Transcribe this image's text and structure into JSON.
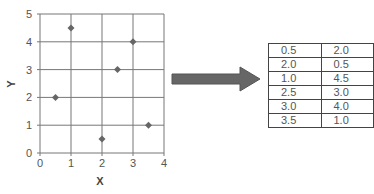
{
  "chart_data": {
    "type": "scatter",
    "title": "",
    "xlabel": "X",
    "ylabel": "Y",
    "xlim": [
      0,
      4
    ],
    "ylim": [
      0,
      5
    ],
    "x_ticks": [
      "0",
      "1",
      "2",
      "3",
      "4"
    ],
    "y_ticks": [
      "0",
      "1",
      "2",
      "3",
      "4",
      "5"
    ],
    "grid": true,
    "legend": null,
    "series": [
      {
        "name": "points",
        "marker": "diamond",
        "color": "#666666",
        "points": [
          {
            "x": 0.5,
            "y": 2.0
          },
          {
            "x": 1.0,
            "y": 4.5
          },
          {
            "x": 2.0,
            "y": 0.5
          },
          {
            "x": 2.5,
            "y": 3.0
          },
          {
            "x": 3.0,
            "y": 4.0
          },
          {
            "x": 3.5,
            "y": 1.0
          }
        ]
      }
    ]
  },
  "arrow": {
    "color": "#666666",
    "direction": "right"
  },
  "table": {
    "rows": [
      [
        "0.5",
        "2.0"
      ],
      [
        "2.0",
        "0.5"
      ],
      [
        "1.0",
        "4.5"
      ],
      [
        "2.5",
        "3.0"
      ],
      [
        "3.0",
        "4.0"
      ],
      [
        "3.5",
        "1.0"
      ]
    ]
  }
}
